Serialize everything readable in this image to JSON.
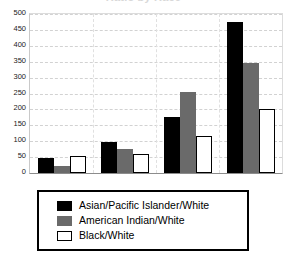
{
  "title_fragment": "Ratio by Race",
  "chart_data": {
    "type": "bar",
    "title": "",
    "xlabel": "",
    "ylabel": "",
    "ylim": [
      0,
      500
    ],
    "ytick_step": 50,
    "yticks": [
      500,
      450,
      400,
      350,
      300,
      250,
      200,
      150,
      100,
      50,
      0
    ],
    "ytick_labels": [
      "500",
      "450",
      "400",
      "350",
      "300",
      "250",
      "200",
      "150",
      "100",
      "50",
      "0"
    ],
    "grid": true,
    "grid_style": "dashed-horizontal",
    "xtick_labels": [
      "",
      "",
      "",
      ""
    ],
    "categories": [
      "1",
      "2",
      "3",
      "4"
    ],
    "legend_position": "below-plot",
    "series": [
      {
        "name": "Asian/Pacific Islander/White",
        "color": "#000000",
        "values": [
          48,
          98,
          175,
          475
        ]
      },
      {
        "name": "American Indian/White",
        "color": "#6a6a6a",
        "values": [
          23,
          74,
          255,
          345
        ]
      },
      {
        "name": "Black/White",
        "color": "#ffffff",
        "border_color": "#000000",
        "values": [
          52,
          60,
          115,
          200
        ]
      }
    ]
  }
}
